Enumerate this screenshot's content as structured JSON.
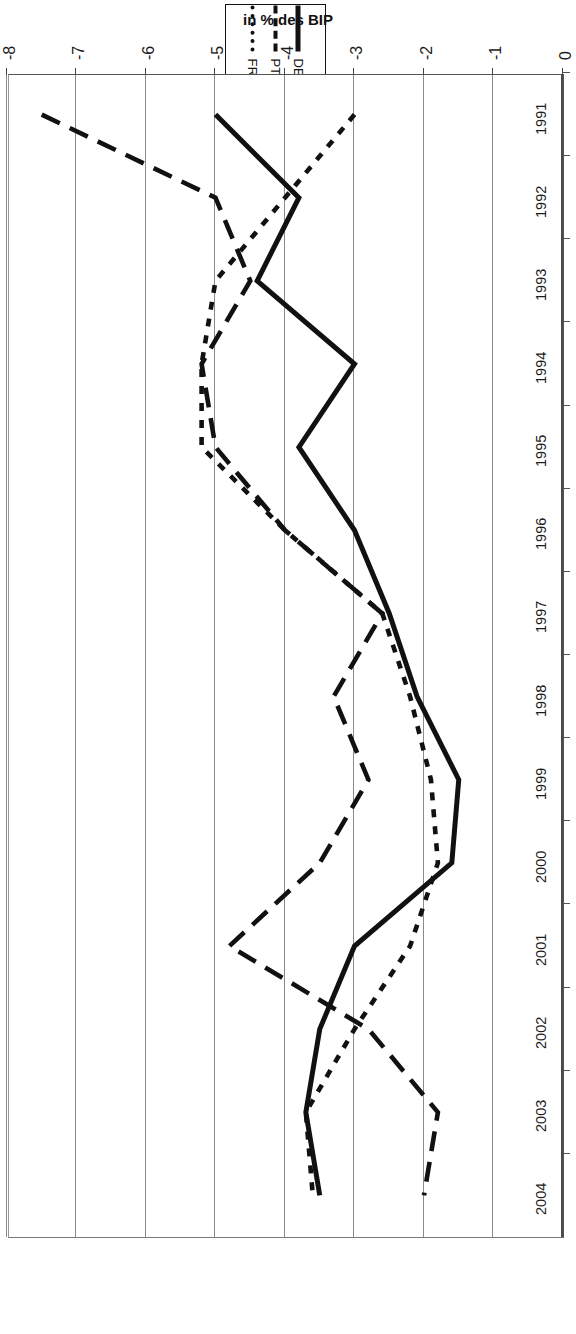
{
  "chart_data": {
    "type": "line",
    "title": "",
    "subtitle": "",
    "xlabel": "",
    "ylabel": "in % des BIP",
    "orientation": "rotated-180",
    "grid": true,
    "legend_position": "outside-top",
    "ylim": [
      -8,
      0
    ],
    "yticks": [
      "0",
      "-1",
      "-2",
      "-3",
      "-4",
      "-5",
      "-6",
      "-7",
      "-8"
    ],
    "ytick_values": [
      0,
      -1,
      -2,
      -3,
      -4,
      -5,
      -6,
      -7,
      -8
    ],
    "categories": [
      "1991",
      "1992",
      "1993",
      "1994",
      "1995",
      "1996",
      "1997",
      "1998",
      "1999",
      "2000",
      "2001",
      "2002",
      "2003",
      "2004"
    ],
    "series": [
      {
        "name": "DE",
        "style": "solid",
        "color": "#111111",
        "values": [
          -5.0,
          -3.8,
          -4.4,
          -3.0,
          -3.8,
          -3.0,
          -2.5,
          -2.1,
          -1.5,
          -1.6,
          -3.0,
          -3.5,
          -3.7,
          -3.5
        ]
      },
      {
        "name": "PT",
        "style": "long-dashed",
        "color": "#111111",
        "values": [
          -7.5,
          -5.0,
          -4.5,
          -5.2,
          -5.0,
          -4.0,
          -2.6,
          -3.3,
          -2.8,
          -3.5,
          -4.8,
          -2.8,
          -1.8,
          -2.0
        ]
      },
      {
        "name": "FR",
        "style": "dotted",
        "color": "#111111",
        "values": [
          -3.0,
          -4.0,
          -5.0,
          -5.2,
          -5.2,
          -4.0,
          -2.6,
          -2.2,
          -1.9,
          -1.8,
          -2.2,
          -3.0,
          -3.7,
          -3.6
        ]
      }
    ]
  },
  "legend": {
    "entries": [
      {
        "label": "DE",
        "icon": "solid-line-swatch"
      },
      {
        "label": "PT",
        "icon": "dashed-line-swatch"
      },
      {
        "label": "FR",
        "icon": "dotted-line-swatch"
      }
    ]
  },
  "axis": {
    "value_axis_title": "in % des BIP",
    "value_ticks": [
      "0",
      "-1",
      "-2",
      "-3",
      "-4",
      "-5",
      "-6",
      "-7",
      "-8"
    ],
    "category_ticks": [
      "1991",
      "1992",
      "1993",
      "1994",
      "1995",
      "1996",
      "1997",
      "1998",
      "1999",
      "2000",
      "2001",
      "2002",
      "2003",
      "2004"
    ]
  },
  "colors": {
    "ink": "#111111",
    "grid": "#8b8b8b",
    "frame": "#555555",
    "background": "#ffffff"
  }
}
